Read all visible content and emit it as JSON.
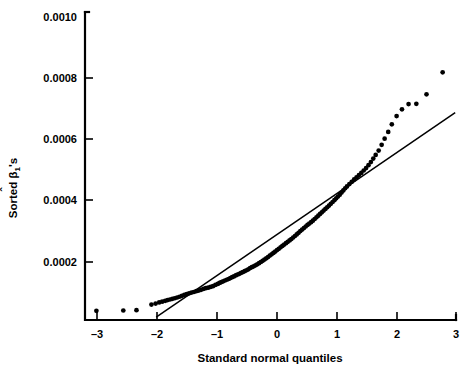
{
  "chart_data": {
    "type": "scatter",
    "title": "",
    "xlabel": "Standard normal quantiles",
    "ylabel": "Sorted β̅1's",
    "ylabel_parts": {
      "prefix": "Sorted ",
      "symbol": "β",
      "hat": "ˆ",
      "subscript": "1",
      "suffix": "'s"
    },
    "xlim": [
      -3.2,
      3.2
    ],
    "ylim": [
      0.0,
      0.00103
    ],
    "grid": false,
    "legend": null,
    "xticks": [
      -3,
      -2,
      -1,
      0,
      1,
      2,
      3
    ],
    "xticklabels": [
      "–3",
      "–2",
      "–1",
      "0",
      "1",
      "2",
      "3"
    ],
    "yticks": [
      0.0002,
      0.0004,
      0.0006,
      0.0008,
      0.001
    ],
    "yticklabels": [
      "0.0002",
      "0.0004",
      "0.0006",
      "0.0008",
      "0.0010"
    ],
    "reference_line": {
      "x": [
        -2.02,
        2.98
      ],
      "y": [
        1.95e-05,
        0.000688
      ],
      "description": "straight fitted normal reference line"
    },
    "series": [
      {
        "name": "Sorted beta-hat quantiles",
        "marker": "filled-circle",
        "color": "#000000",
        "points": [
          [
            -3.02,
            4.05e-05
          ],
          [
            -2.57,
            4.15e-05
          ],
          [
            -2.35,
            4.25e-05
          ],
          [
            -2.1,
            6.1e-05
          ],
          [
            -2.03,
            6.4e-05
          ],
          [
            -1.97,
            6.8e-05
          ],
          [
            -1.92,
            7.05e-05
          ],
          [
            -1.87,
            7.3e-05
          ],
          [
            -1.83,
            7.55e-05
          ],
          [
            -1.79,
            7.75e-05
          ],
          [
            -1.75,
            7.95e-05
          ],
          [
            -1.71,
            8.15e-05
          ],
          [
            -1.67,
            8.4e-05
          ],
          [
            -1.63,
            8.65e-05
          ],
          [
            -1.59,
            8.95e-05
          ],
          [
            -1.55,
            9.25e-05
          ],
          [
            -1.51,
            9.5e-05
          ],
          [
            -1.47,
            9.75e-05
          ],
          [
            -1.43,
            0.0001
          ],
          [
            -1.39,
            0.000102
          ],
          [
            -1.35,
            0.0001045
          ],
          [
            -1.31,
            0.0001065
          ],
          [
            -1.27,
            0.000109
          ],
          [
            -1.23,
            0.000112
          ],
          [
            -1.19,
            0.0001145
          ],
          [
            -1.15,
            0.000116
          ],
          [
            -1.11,
            0.0001185
          ],
          [
            -1.07,
            0.000121
          ],
          [
            -1.03,
            0.000125
          ],
          [
            -0.99,
            0.0001285
          ],
          [
            -0.96,
            0.0001315
          ],
          [
            -0.93,
            0.0001345
          ],
          [
            -0.9,
            0.000137
          ],
          [
            -0.87,
            0.0001395
          ],
          [
            -0.84,
            0.000142
          ],
          [
            -0.81,
            0.0001445
          ],
          [
            -0.78,
            0.0001475
          ],
          [
            -0.75,
            0.0001505
          ],
          [
            -0.72,
            0.000153
          ],
          [
            -0.69,
            0.000156
          ],
          [
            -0.66,
            0.000159
          ],
          [
            -0.63,
            0.0001615
          ],
          [
            -0.6,
            0.0001645
          ],
          [
            -0.57,
            0.000167
          ],
          [
            -0.54,
            0.00017
          ],
          [
            -0.51,
            0.000173
          ],
          [
            -0.48,
            0.000176
          ],
          [
            -0.45,
            0.00018
          ],
          [
            -0.42,
            0.000183
          ],
          [
            -0.39,
            0.000186
          ],
          [
            -0.36,
            0.000189
          ],
          [
            -0.33,
            0.0001925
          ],
          [
            -0.3,
            0.000196
          ],
          [
            -0.27,
            0.0002
          ],
          [
            -0.24,
            0.000204
          ],
          [
            -0.21,
            0.000208
          ],
          [
            -0.18,
            0.000212
          ],
          [
            -0.15,
            0.000216
          ],
          [
            -0.12,
            0.000221
          ],
          [
            -0.09,
            0.000225
          ],
          [
            -0.06,
            0.0002295
          ],
          [
            -0.03,
            0.000234
          ],
          [
            0.0,
            0.000239
          ],
          [
            0.03,
            0.000243
          ],
          [
            0.06,
            0.000248
          ],
          [
            0.09,
            0.0002525
          ],
          [
            0.12,
            0.000257
          ],
          [
            0.15,
            0.0002615
          ],
          [
            0.18,
            0.000266
          ],
          [
            0.21,
            0.0002705
          ],
          [
            0.24,
            0.000275
          ],
          [
            0.27,
            0.00028
          ],
          [
            0.3,
            0.000285
          ],
          [
            0.33,
            0.00029
          ],
          [
            0.36,
            0.0002955
          ],
          [
            0.39,
            0.000301
          ],
          [
            0.42,
            0.000306
          ],
          [
            0.45,
            0.000311
          ],
          [
            0.48,
            0.000316
          ],
          [
            0.51,
            0.000321
          ],
          [
            0.54,
            0.0003255
          ],
          [
            0.57,
            0.00033
          ],
          [
            0.6,
            0.000335
          ],
          [
            0.63,
            0.0003405
          ],
          [
            0.66,
            0.000346
          ],
          [
            0.69,
            0.0003515
          ],
          [
            0.72,
            0.000357
          ],
          [
            0.75,
            0.0003625
          ],
          [
            0.78,
            0.000368
          ],
          [
            0.81,
            0.0003735
          ],
          [
            0.84,
            0.000379
          ],
          [
            0.87,
            0.0003845
          ],
          [
            0.9,
            0.00039
          ],
          [
            0.93,
            0.000396
          ],
          [
            0.96,
            0.000402
          ],
          [
            0.99,
            0.000408
          ],
          [
            1.02,
            0.000414
          ],
          [
            1.05,
            0.00042
          ],
          [
            1.08,
            0.000427
          ],
          [
            1.11,
            0.000434
          ],
          [
            1.14,
            0.000441
          ],
          [
            1.17,
            0.000447
          ],
          [
            1.21,
            0.0004545
          ],
          [
            1.25,
            0.000462
          ],
          [
            1.29,
            0.00047
          ],
          [
            1.33,
            0.000477
          ],
          [
            1.37,
            0.000484
          ],
          [
            1.41,
            0.000491
          ],
          [
            1.45,
            0.000499
          ],
          [
            1.49,
            0.000507
          ],
          [
            1.53,
            0.0005165
          ],
          [
            1.57,
            0.0005265
          ],
          [
            1.61,
            0.000538
          ],
          [
            1.65,
            0.00055
          ],
          [
            1.7,
            0.000564
          ],
          [
            1.75,
            0.000583
          ],
          [
            1.8,
            0.000603
          ],
          [
            1.86,
            0.000625
          ],
          [
            1.92,
            0.00065
          ],
          [
            2.0,
            0.000677
          ],
          [
            2.09,
            0.000699
          ],
          [
            2.2,
            0.000716
          ],
          [
            2.33,
            0.000717
          ],
          [
            2.5,
            0.000748
          ],
          [
            2.77,
            0.00082
          ]
        ]
      }
    ],
    "annotations": []
  }
}
